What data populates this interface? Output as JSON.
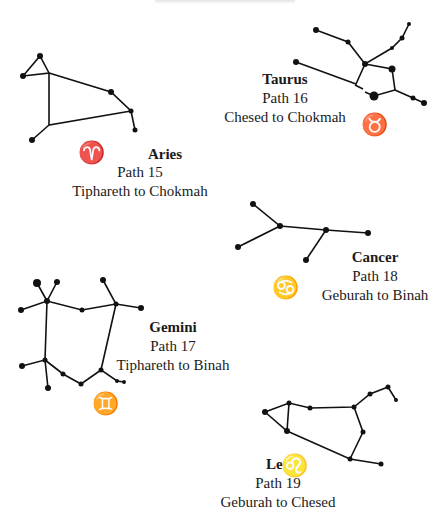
{
  "page": {
    "header_partial": "(cut-off header text)"
  },
  "constellations": [
    {
      "name": "Aries",
      "path": "Path 15",
      "route": "Tiphareth to Chokmah",
      "symbol": "♈"
    },
    {
      "name": "Taurus",
      "path": "Path 16",
      "route": "Chesed to Chokmah",
      "symbol": "♉"
    },
    {
      "name": "Cancer",
      "path": "Path 18",
      "route": "Geburah to Binah",
      "symbol": "♋"
    },
    {
      "name": "Gemini",
      "path": "Path 17",
      "route": "Tiphareth to Binah",
      "symbol": "♊"
    },
    {
      "name": "Leo",
      "path": "Path 19",
      "route": "Geburah to Chesed",
      "symbol": "♌"
    }
  ]
}
